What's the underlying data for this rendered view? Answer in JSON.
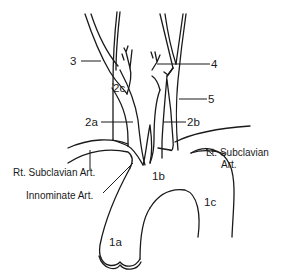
{
  "diagram": {
    "type": "anatomical-line-drawing",
    "colors": {
      "line": "#1a1a1a",
      "background": "#ffffff"
    },
    "labels": {
      "n3": "3",
      "n4": "4",
      "n5": "5",
      "n2a": "2a",
      "n2b": "2b",
      "n2c": "2c",
      "n1a": "1a",
      "n1b": "1b",
      "n1c": "1c",
      "rt_subclavian": "Rt. Subclavian Art.",
      "innominate": "Innominate Art.",
      "lt_subclavian_line1": "Lt. Subclavian",
      "lt_subclavian_line2": "Art."
    }
  }
}
